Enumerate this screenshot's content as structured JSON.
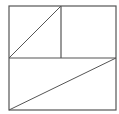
{
  "diagram": {
    "stroke_color": "#555555",
    "background": "#ffffff",
    "outer_square": {
      "x": 9,
      "y": 6,
      "width": 107,
      "height": 104
    },
    "horizontal_divider": {
      "x1": 9,
      "y1": 58,
      "x2": 116,
      "y2": 58
    },
    "vertical_divider": {
      "x1": 61,
      "y1": 6,
      "x2": 61,
      "y2": 58
    },
    "top_left_diagonal": {
      "x1": 9,
      "y1": 58,
      "x2": 61,
      "y2": 6
    },
    "bottom_diagonal": {
      "x1": 9,
      "y1": 110,
      "x2": 116,
      "y2": 58
    }
  }
}
